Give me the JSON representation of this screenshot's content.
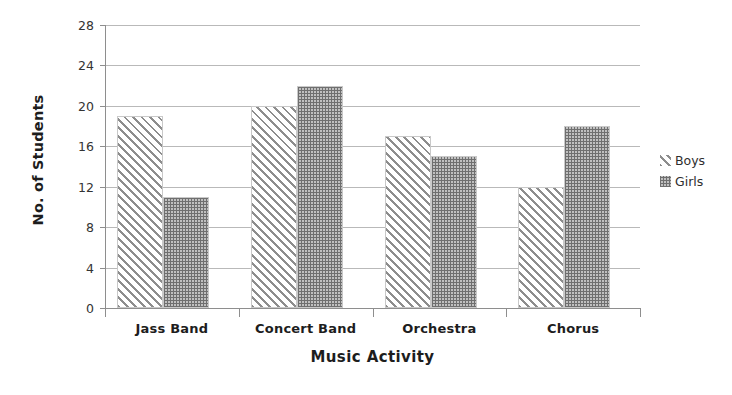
{
  "chart_data": {
    "type": "bar",
    "title": "",
    "xlabel": "Music Activity",
    "ylabel": "No. of Students",
    "categories": [
      "Jass Band",
      "Concert Band",
      "Orchestra",
      "Chorus"
    ],
    "series": [
      {
        "name": "Boys",
        "values": [
          19,
          20,
          17,
          12
        ],
        "pattern": "diagonal-hatch"
      },
      {
        "name": "Girls",
        "values": [
          11,
          22,
          15,
          18
        ],
        "pattern": "dotted-fill"
      }
    ],
    "ylim": [
      0,
      28
    ],
    "ytick_step": 4,
    "yticks": [
      0,
      4,
      8,
      12,
      16,
      20,
      24,
      28
    ],
    "ytick_labels": [
      "0",
      "4",
      "8",
      "12",
      "16",
      "20",
      "24",
      "28"
    ],
    "grid": true,
    "grid_axis": "y",
    "legend_position": "right",
    "colors": {
      "gridline": "#b9b9b9",
      "axis": "#8e8e8e",
      "boys_pattern": "#8d8d8d",
      "girls_pattern": "#6f6f6f",
      "girls_fill": "#c0c0c0",
      "text": "#1d1d1d",
      "background": "#ffffff"
    }
  },
  "legend": {
    "entries": [
      {
        "label": "Boys",
        "swatch": "diagonal-hatch-swatch"
      },
      {
        "label": "Girls",
        "swatch": "dotted-fill-swatch"
      }
    ]
  }
}
